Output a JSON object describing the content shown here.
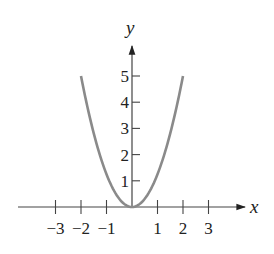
{
  "chart_data": {
    "type": "line",
    "title": "",
    "xlabel": "x",
    "ylabel": "y",
    "function": "y = 1.25 x^2",
    "x_ticks": [
      -3,
      -2,
      -1,
      1,
      2,
      3
    ],
    "y_ticks": [
      1,
      2,
      3,
      4,
      5
    ],
    "x_tick_labels": [
      "−3",
      "−2",
      "−1",
      "1",
      "2",
      "3"
    ],
    "y_tick_labels": [
      "1",
      "2",
      "3",
      "4",
      "5"
    ],
    "xlim": [
      -3.2,
      4.4
    ],
    "ylim": [
      -0.5,
      6.5
    ],
    "grid": false,
    "legend": null,
    "series": [
      {
        "name": "parabola",
        "color": "#8a8a8a",
        "x": [
          -2,
          -1.5,
          -1,
          -0.5,
          0,
          0.5,
          1,
          1.5,
          2
        ],
        "y": [
          5,
          2.8125,
          1.25,
          0.3125,
          0,
          0.3125,
          1.25,
          2.8125,
          5
        ]
      }
    ]
  }
}
